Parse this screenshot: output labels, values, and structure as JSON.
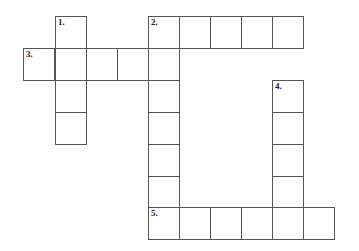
{
  "puzzle": {
    "type": "crossword",
    "clue_numbers": [
      "1.",
      "2.",
      "3.",
      "4.",
      "5."
    ],
    "cells": [
      {
        "x": 55,
        "y": 16,
        "label": "1."
      },
      {
        "x": 55,
        "y": 48
      },
      {
        "x": 55,
        "y": 80
      },
      {
        "x": 55,
        "y": 112
      },
      {
        "x": 148,
        "y": 16,
        "label": "2."
      },
      {
        "x": 179,
        "y": 16
      },
      {
        "x": 210,
        "y": 16
      },
      {
        "x": 241,
        "y": 16
      },
      {
        "x": 272,
        "y": 16
      },
      {
        "x": 23,
        "y": 48,
        "label": "3."
      },
      {
        "x": 86,
        "y": 48
      },
      {
        "x": 117,
        "y": 48
      },
      {
        "x": 148,
        "y": 48
      },
      {
        "x": 148,
        "y": 80
      },
      {
        "x": 148,
        "y": 112
      },
      {
        "x": 148,
        "y": 144
      },
      {
        "x": 148,
        "y": 176
      },
      {
        "x": 272,
        "y": 80,
        "label": "4."
      },
      {
        "x": 272,
        "y": 112
      },
      {
        "x": 272,
        "y": 144
      },
      {
        "x": 272,
        "y": 176
      },
      {
        "x": 148,
        "y": 207,
        "label": "5."
      },
      {
        "x": 179,
        "y": 207
      },
      {
        "x": 210,
        "y": 207
      },
      {
        "x": 241,
        "y": 207
      },
      {
        "x": 272,
        "y": 207
      },
      {
        "x": 303,
        "y": 207
      }
    ]
  }
}
